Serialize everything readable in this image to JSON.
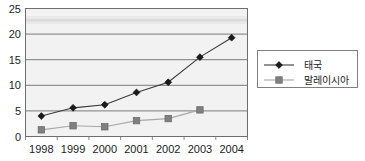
{
  "chart_data": {
    "type": "line",
    "title": "",
    "xlabel": "",
    "ylabel": "",
    "categories": [
      "1998",
      "1999",
      "2000",
      "2001",
      "2002",
      "2003",
      "2004"
    ],
    "ylim": [
      0,
      25
    ],
    "yticks": [
      0,
      5,
      10,
      15,
      20,
      25
    ],
    "ytick_labels": [
      "0",
      "5",
      "10",
      "15",
      "20",
      "25"
    ],
    "grid": "horizontal",
    "legend_position": "right",
    "series": [
      {
        "name": "태국",
        "marker": "diamond",
        "color": "#1a1a1a",
        "line_color": "#3a3a3a",
        "values": [
          4.0,
          5.6,
          6.2,
          8.6,
          10.6,
          15.5,
          19.3
        ]
      },
      {
        "name": "말레이시아",
        "marker": "square",
        "color": "#808080",
        "line_color": "#a8a8a8",
        "values": [
          1.3,
          2.1,
          1.9,
          3.1,
          3.5,
          5.2,
          null
        ]
      }
    ],
    "plot_background": "#f2f2f2",
    "grid_color": "#7a7a7a",
    "border_color": "#6e6e6e"
  },
  "legend": {
    "entries": [
      {
        "label": "태국",
        "marker": "diamond-marker"
      },
      {
        "label": "말레이시아",
        "marker": "square-marker"
      }
    ]
  }
}
